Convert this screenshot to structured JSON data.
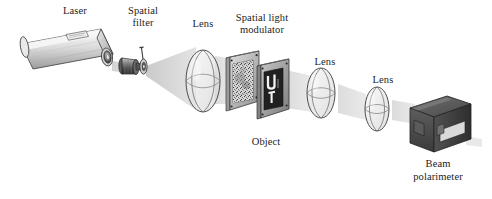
{
  "figure": {
    "background_color": "#ffffff",
    "line_color": "#2a2a2a",
    "beam_color": "#cfcfcf",
    "text_color": "#1d1d1d"
  },
  "labels": {
    "laser": "Laser",
    "spatial_filter_line1": "Spatial",
    "spatial_filter_line2": "filter",
    "lens1": "Lens",
    "slm_line1": "Spatial light",
    "slm_line2": "modulator",
    "object": "Object",
    "lens2": "Lens",
    "lens3": "Lens",
    "polarimeter_line1": "Beam",
    "polarimeter_line2": "polarimeter"
  },
  "components": [
    {
      "id": "laser",
      "name": "laser",
      "label": "Laser",
      "shape": "cylinder",
      "fill": "#d8d8d8",
      "order": 1
    },
    {
      "id": "spatial-filter",
      "name": "spatial-filter",
      "label": "Spatial filter",
      "shape": "barrel-with-pinhole",
      "fill": "#6f6f6f",
      "order": 2
    },
    {
      "id": "lens-1",
      "name": "lens-1",
      "label": "Lens",
      "shape": "ellipse-wireframe",
      "fill": "#e6e6e6",
      "order": 3
    },
    {
      "id": "spatial-light-modulator",
      "name": "spatial-light-modulator",
      "label": "Spatial light modulator",
      "shape": "framed-plate",
      "fill": "#b9b9b9",
      "pattern": "speckle",
      "order": 4
    },
    {
      "id": "object",
      "name": "object",
      "label": "Object",
      "shape": "framed-plate",
      "fill": "#8e8e8e",
      "pattern": "letters",
      "glyphs": "U T",
      "order": 5
    },
    {
      "id": "lens-2",
      "name": "lens-2",
      "label": "Lens",
      "shape": "ellipse-wireframe",
      "fill": "#ececec",
      "order": 6
    },
    {
      "id": "lens-3",
      "name": "lens-3",
      "label": "Lens",
      "shape": "ellipse-wireframe",
      "fill": "#f0f0f0",
      "order": 7
    },
    {
      "id": "beam-polarimeter",
      "name": "beam-polarimeter",
      "label": "Beam polarimeter",
      "shape": "box",
      "fill": "#4a4a4a",
      "order": 8
    }
  ],
  "beam": {
    "name": "light-beam",
    "description": "Light beam propagating left to right through all elements",
    "color": "#d0d0d0"
  }
}
